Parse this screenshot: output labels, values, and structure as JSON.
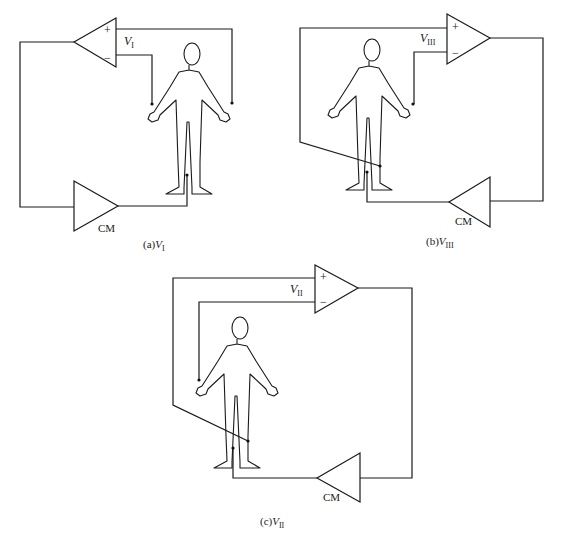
{
  "figure": {
    "panels": [
      {
        "id": "a",
        "caption_prefix": "(a)",
        "caption_var": "V",
        "caption_sub": "I",
        "amp_label_var": "V",
        "amp_label_sub": "I",
        "plus_sign": "+",
        "minus_sign": "−",
        "cm_label": "CM",
        "plus_input": "left-hand electrode",
        "minus_input": "right-hand electrode",
        "cm_output": "right-leg electrode"
      },
      {
        "id": "b",
        "caption_prefix": "(b)",
        "caption_var": "V",
        "caption_sub": "III",
        "amp_label_var": "V",
        "amp_label_sub": "III",
        "plus_sign": "+",
        "minus_sign": "−",
        "cm_label": "CM",
        "plus_input": "left-leg electrode",
        "minus_input": "left-hand electrode",
        "cm_output": "right-leg electrode"
      },
      {
        "id": "c",
        "caption_prefix": "(c)",
        "caption_var": "V",
        "caption_sub": "II",
        "amp_label_var": "V",
        "amp_label_sub": "II",
        "plus_sign": "+",
        "minus_sign": "−",
        "cm_label": "CM",
        "plus_input": "left-leg electrode",
        "minus_input": "right-hand electrode",
        "cm_output": "right-leg electrode"
      }
    ]
  },
  "colors": {
    "line": "#1a1a1a",
    "background": "#ffffff"
  }
}
